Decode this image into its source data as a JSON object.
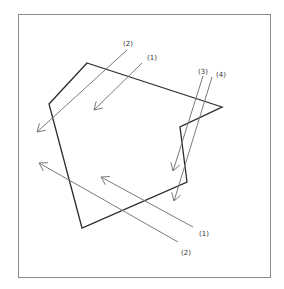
{
  "colors": {
    "frame": "#8a8a8a",
    "polygon": "#2b2b2b",
    "arrow": "#7a7a7a",
    "label": "#333333"
  },
  "frame": {
    "x": 18,
    "y": 14,
    "width": 252,
    "height": 263
  },
  "polygon": {
    "points": "87,63 222,107 180,127 187,182 82,228 49,104"
  },
  "arrows": [
    {
      "id": "top-2",
      "label": "(2)",
      "x1": 127,
      "y1": 50,
      "x2": 37,
      "y2": 132,
      "label_x": 123,
      "label_y": 46
    },
    {
      "id": "top-1",
      "label": "(1)",
      "x1": 142,
      "y1": 63,
      "x2": 94,
      "y2": 110,
      "label_x": 147,
      "label_y": 60
    },
    {
      "id": "right-3",
      "label": "(3)",
      "x1": 203,
      "y1": 76,
      "x2": 173,
      "y2": 171,
      "label_x": 198,
      "label_y": 74
    },
    {
      "id": "right-4",
      "label": "(4)",
      "x1": 212,
      "y1": 77,
      "x2": 174,
      "y2": 201,
      "label_x": 216,
      "label_y": 77
    },
    {
      "id": "bottom-1",
      "label": "(1)",
      "x1": 193,
      "y1": 227,
      "x2": 101,
      "y2": 177,
      "label_x": 199,
      "label_y": 236
    },
    {
      "id": "bottom-2",
      "label": "(2)",
      "x1": 178,
      "y1": 242,
      "x2": 39,
      "y2": 163,
      "label_x": 181,
      "label_y": 255
    }
  ]
}
